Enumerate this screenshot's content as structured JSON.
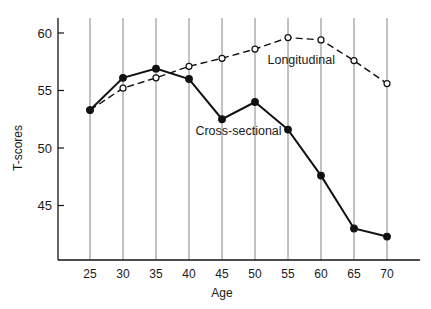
{
  "chart_data": {
    "type": "line",
    "title": "",
    "xlabel": "Age",
    "ylabel": "T-scores",
    "x": [
      25,
      30,
      35,
      40,
      45,
      50,
      55,
      60,
      65,
      70
    ],
    "xticks": [
      "25",
      "30",
      "35",
      "40",
      "45",
      "50",
      "55",
      "60",
      "65",
      "70"
    ],
    "yticks": [
      "45",
      "50",
      "55",
      "60"
    ],
    "ylim": [
      40.2,
      61.2
    ],
    "grid": "vertical lines at each age",
    "legend": "inline labels",
    "series": [
      {
        "name": "Longitudinal",
        "style": "dashed, open circles",
        "values": [
          53.3,
          55.2,
          56.1,
          57.1,
          57.8,
          58.6,
          59.6,
          59.4,
          57.6,
          55.6
        ]
      },
      {
        "name": "Cross-sectional",
        "style": "solid, filled circles",
        "values": [
          53.3,
          56.1,
          56.9,
          56.0,
          52.5,
          54.0,
          51.6,
          47.6,
          43.0,
          42.3
        ]
      }
    ],
    "annotations": [
      {
        "text": "Longitudinal",
        "x": 57,
        "y": 57.3
      },
      {
        "text": "Cross-sectional",
        "x": 47.5,
        "y": 51.1
      }
    ]
  }
}
